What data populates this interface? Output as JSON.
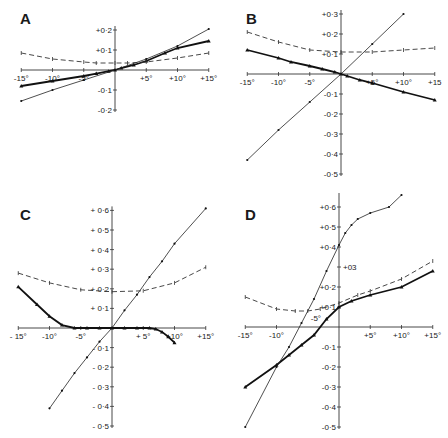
{
  "figure": {
    "background": "#ffffff",
    "ink": "#111111"
  },
  "chart_data": [
    {
      "panel": "A",
      "type": "line",
      "xlabel": "",
      "ylabel": "",
      "xlim": [
        -15,
        15
      ],
      "ylim": [
        -0.2,
        0.2
      ],
      "x_ticks": [
        "-15°",
        "-10°",
        "-5°",
        "+5°",
        "+10°",
        "+15°"
      ],
      "y_ticks": [
        "+0·2",
        "+0·1",
        "-0·1",
        "-0·2"
      ],
      "grid": false,
      "series": [
        {
          "name": "thick (solid, heavy)",
          "style": "thick",
          "x": [
            -15,
            -10,
            -5,
            -3,
            -1,
            0,
            1,
            3,
            5,
            8,
            10,
            15
          ],
          "y": [
            -0.08,
            -0.055,
            -0.03,
            -0.018,
            -0.006,
            0.0,
            0.01,
            0.025,
            0.045,
            0.085,
            0.11,
            0.145
          ]
        },
        {
          "name": "thin (solid)",
          "style": "thin",
          "x": [
            -15,
            -10,
            -5,
            0,
            5,
            10,
            15
          ],
          "y": [
            -0.155,
            -0.1,
            -0.05,
            0.0,
            0.055,
            0.12,
            0.205
          ]
        },
        {
          "name": "dashed",
          "style": "dash",
          "x": [
            -15,
            -10,
            -5,
            -3,
            0,
            2,
            5,
            10,
            15
          ],
          "y": [
            0.085,
            0.055,
            0.04,
            0.035,
            0.035,
            0.035,
            0.04,
            0.06,
            0.085
          ]
        }
      ]
    },
    {
      "panel": "B",
      "type": "line",
      "xlabel": "",
      "ylabel": "",
      "xlim": [
        -15,
        15
      ],
      "ylim": [
        -0.5,
        0.3
      ],
      "x_ticks": [
        "-15°",
        "-10°",
        "-5°",
        "+5°",
        "+10°",
        "+15"
      ],
      "y_ticks": [
        "+0·3",
        "+0·2",
        "+0·1",
        "-0·1",
        "-0·2",
        "-0·3",
        "-0·4",
        "-0·5"
      ],
      "grid": false,
      "series": [
        {
          "name": "thick (solid, heavy)",
          "style": "thick",
          "x": [
            -15,
            -10,
            -8,
            -5,
            -3,
            -1,
            0,
            1,
            3,
            5,
            10,
            15
          ],
          "y": [
            0.12,
            0.08,
            0.06,
            0.04,
            0.025,
            0.01,
            0.0,
            -0.01,
            -0.03,
            -0.045,
            -0.09,
            -0.13
          ]
        },
        {
          "name": "thin (solid)",
          "style": "thin",
          "x": [
            -15,
            -10,
            -5,
            0,
            5,
            10
          ],
          "y": [
            -0.43,
            -0.28,
            -0.14,
            0.0,
            0.15,
            0.3
          ]
        },
        {
          "name": "dashed",
          "style": "dash",
          "x": [
            -15,
            -10,
            -5,
            0,
            5,
            10,
            15
          ],
          "y": [
            0.21,
            0.16,
            0.12,
            0.11,
            0.11,
            0.12,
            0.13
          ]
        }
      ]
    },
    {
      "panel": "C",
      "type": "line",
      "xlabel": "",
      "ylabel": "",
      "xlim": [
        -15,
        15
      ],
      "ylim": [
        -0.5,
        0.6
      ],
      "x_ticks": [
        "- 15°",
        "-10°",
        "-5°",
        "+ 5°",
        "+10°",
        "+15°"
      ],
      "y_ticks": [
        "+ 0·6",
        "+ 0·5",
        "+ 0·4",
        "+ 0·3",
        "+ 0·2",
        "+ 0·1",
        "- 0·1",
        "- 0·2",
        "- 0·3",
        "- 0·4",
        "- 0·5"
      ],
      "grid": false,
      "series": [
        {
          "name": "thick (solid, heavy)",
          "style": "thick",
          "x": [
            -15,
            -12,
            -10,
            -8,
            -6,
            -4,
            -2,
            0,
            2,
            4,
            6,
            7,
            8,
            9,
            10
          ],
          "y": [
            0.21,
            0.12,
            0.06,
            0.015,
            0.0,
            0.0,
            0.0,
            0.0,
            0.0,
            0.0,
            0.0,
            -0.005,
            -0.02,
            -0.045,
            -0.075
          ]
        },
        {
          "name": "thin (solid)",
          "style": "thin",
          "x": [
            -10,
            -8,
            -6,
            -4,
            -2,
            0,
            2,
            4,
            6,
            8,
            10,
            15
          ],
          "y": [
            -0.41,
            -0.32,
            -0.23,
            -0.15,
            -0.07,
            0.0,
            0.09,
            0.17,
            0.26,
            0.34,
            0.43,
            0.61
          ]
        },
        {
          "name": "dashed",
          "style": "dash",
          "x": [
            -15,
            -10,
            -5,
            0,
            5,
            10,
            15
          ],
          "y": [
            0.28,
            0.23,
            0.195,
            0.185,
            0.19,
            0.23,
            0.31
          ]
        }
      ]
    },
    {
      "panel": "D",
      "type": "line",
      "xlabel": "",
      "ylabel": "",
      "xlim": [
        -15,
        15
      ],
      "ylim": [
        -0.5,
        0.65
      ],
      "x_ticks": [
        "-15°",
        "-10°",
        "+5°",
        "+10°",
        "+15°"
      ],
      "y_ticks": [
        "+0·6",
        "+0·5",
        "+0·4",
        "+03",
        "+0·2",
        "+0·1",
        "-0·1",
        "-0·2",
        "-0·3",
        "-0·4",
        "-0·5"
      ],
      "annotations": [
        "-5°"
      ],
      "grid": false,
      "series": [
        {
          "name": "thick (solid, heavy)",
          "style": "thick",
          "x": [
            -15,
            -10,
            -8,
            -6,
            -4,
            -2,
            0,
            2,
            5,
            10,
            15
          ],
          "y": [
            -0.3,
            -0.19,
            -0.14,
            -0.09,
            -0.04,
            0.04,
            0.1,
            0.13,
            0.16,
            0.2,
            0.28
          ]
        },
        {
          "name": "thin (solid)",
          "style": "thin",
          "x": [
            -15,
            -10,
            -8,
            -6,
            -4,
            -2,
            0,
            1,
            2,
            3,
            5,
            8,
            10
          ],
          "y": [
            -0.5,
            -0.2,
            -0.1,
            0.02,
            0.14,
            0.28,
            0.41,
            0.47,
            0.51,
            0.54,
            0.57,
            0.6,
            0.66
          ]
        },
        {
          "name": "dashed",
          "style": "dash",
          "x": [
            -15,
            -10,
            -7,
            -5,
            -3,
            0,
            3,
            5,
            10,
            15
          ],
          "y": [
            0.15,
            0.09,
            0.08,
            0.08,
            0.09,
            0.12,
            0.16,
            0.18,
            0.24,
            0.33
          ]
        }
      ]
    }
  ],
  "panels": {
    "A": {
      "label": "A",
      "ox": 115,
      "oy": 70,
      "xs": 6.25,
      "ys": 200
    },
    "B": {
      "label": "B",
      "ox": 341,
      "oy": 74,
      "xs": 6.25,
      "ys": 200
    },
    "C": {
      "label": "C",
      "ox": 112,
      "oy": 328,
      "xs": 6.25,
      "ys": 196
    },
    "D": {
      "label": "D",
      "ox": 339,
      "oy": 327,
      "xs": 6.25,
      "ys": 200
    }
  }
}
